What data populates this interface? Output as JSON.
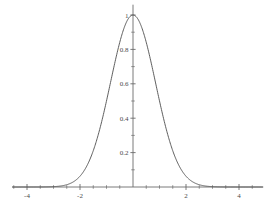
{
  "chart_data": {
    "type": "line",
    "title": "",
    "subtitle": "",
    "xlabel": "",
    "ylabel": "",
    "xlim": [
      -4.55,
      4.9
    ],
    "ylim": [
      0,
      1.06
    ],
    "grid": false,
    "legend": null,
    "curve_color": "#555555",
    "axis_color": "#6b6b6b",
    "background": "#ffffff",
    "function_description": "Gaussian bell curve, peak 1 at x = 0",
    "peak": {
      "x": 0,
      "y": 1
    },
    "sigma": 0.85,
    "x_ticks_major": [
      -4,
      -2,
      2,
      4
    ],
    "x_tick_labels": [
      "-4",
      "-2",
      "2",
      "4"
    ],
    "x_ticks_minor": [
      -4.5,
      -3.5,
      -3,
      -2.5,
      -1.5,
      -1,
      -0.5,
      0.5,
      1,
      1.5,
      2.5,
      3,
      3.5,
      4.5
    ],
    "y_ticks_major": [
      0.2,
      0.4,
      0.6,
      0.8,
      1
    ],
    "y_tick_labels": [
      "0.2",
      "0.4",
      "0.6",
      "0.8",
      "1"
    ],
    "y_ticks_minor": [
      0.1,
      0.3,
      0.5,
      0.7,
      0.9
    ],
    "x": [
      -4.5,
      -4.25,
      -4,
      -3.75,
      -3.5,
      -3.25,
      -3,
      -2.75,
      -2.5,
      -2.25,
      -2,
      -1.75,
      -1.5,
      -1.25,
      -1,
      -0.75,
      -0.5,
      -0.25,
      0,
      0.25,
      0.5,
      0.75,
      1,
      1.25,
      1.5,
      1.75,
      2,
      2.25,
      2.5,
      2.75,
      3,
      3.25,
      3.5,
      3.75,
      4,
      4.25,
      4.5,
      4.75,
      4.9
    ],
    "y": [
      0.0,
      0.0,
      0.0,
      0.0001,
      0.0003,
      0.0012,
      0.0042,
      0.0123,
      0.0312,
      0.0693,
      0.134,
      0.2258,
      0.3314,
      0.4237,
      0.5023,
      0.6747,
      0.8375,
      0.9577,
      1.0,
      0.9577,
      0.8375,
      0.6747,
      0.5023,
      0.4237,
      0.3314,
      0.2258,
      0.134,
      0.0693,
      0.0312,
      0.0123,
      0.0042,
      0.0012,
      0.0003,
      0.0001,
      0.0,
      0.0,
      0.0,
      0.0,
      0.0
    ]
  }
}
